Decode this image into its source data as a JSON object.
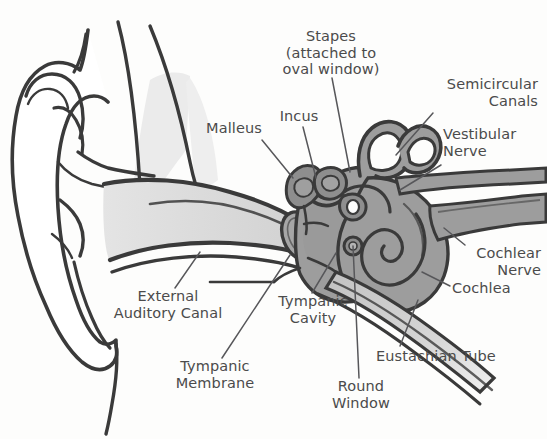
{
  "diagram": {
    "background_color": "#fdfdfc",
    "text_color": "#4b4b4b",
    "outline_color": "#3a3a3a",
    "leader_color": "#57575a",
    "fills": {
      "outer_ear": "#ffffff",
      "ear_canal_light_gray": "#dcdcdc",
      "bone_pale_gray": "#e9e9e9",
      "inner_ear_mid_gray": "#9d9d9d",
      "ossicle_gray": "#8e8e8e",
      "tympanic_membrane_gray": "#a4a4a4",
      "eustachian_gray": "#cfcfcf"
    }
  },
  "labels": {
    "stapes": {
      "lines": [
        "Stapes",
        "(attached to",
        "oval window)"
      ],
      "text": "Stapes\n(attached to\noval window)",
      "align": "center",
      "x": 266,
      "y": 28,
      "width": 130,
      "leader": {
        "from": [
          332,
          78
        ],
        "to": [
          350,
          172
        ]
      }
    },
    "incus": {
      "lines": [
        "Incus"
      ],
      "text": "Incus",
      "align": "center",
      "x": 268,
      "y": 108,
      "width": 62,
      "leader": {
        "from": [
          303,
          127
        ],
        "to": [
          316,
          178
        ]
      }
    },
    "malleus": {
      "lines": [
        "Malleus"
      ],
      "text": "Malleus",
      "align": "center",
      "x": 198,
      "y": 120,
      "width": 72,
      "leader": {
        "from": [
          262,
          140
        ],
        "to": [
          293,
          178
        ]
      }
    },
    "semicircular_canals": {
      "lines": [
        "Semicircular",
        "Canals"
      ],
      "text": "Semicircular\nCanals",
      "align": "right",
      "x": 420,
      "y": 76,
      "width": 118,
      "leader": {
        "from": [
          433,
          113
        ],
        "to": [
          396,
          155
        ]
      }
    },
    "vestibular_nerve": {
      "lines": [
        "Vestibular",
        "Nerve"
      ],
      "text": "Vestibular\nNerve",
      "align": "left",
      "x": 443,
      "y": 126,
      "width": 100,
      "leader": {
        "from": [
          441,
          165
        ],
        "to": [
          400,
          190
        ]
      }
    },
    "cochlear_nerve": {
      "lines": [
        "Cochlear",
        "Nerve"
      ],
      "text": "Cochlear\nNerve",
      "align": "right",
      "x": 455,
      "y": 245,
      "width": 86,
      "leader": {
        "from": [
          465,
          245
        ],
        "to": [
          444,
          228
        ]
      }
    },
    "cochlea": {
      "lines": [
        "Cochlea"
      ],
      "text": "Cochlea",
      "align": "left",
      "x": 452,
      "y": 280,
      "width": 80,
      "leader": {
        "from": [
          450,
          286
        ],
        "to": [
          422,
          272
        ]
      }
    },
    "external_auditory_canal": {
      "lines": [
        "External",
        "Auditory Canal"
      ],
      "text": "External\nAuditory Canal",
      "align": "center",
      "x": 93,
      "y": 288,
      "width": 150,
      "leader": {
        "from": [
          175,
          288
        ],
        "to": [
          200,
          252
        ]
      }
    },
    "tympanic_membrane": {
      "lines": [
        "Tympanic",
        "Membrane"
      ],
      "text": "Tympanic\nMembrane",
      "align": "center",
      "x": 160,
      "y": 358,
      "width": 110,
      "leader": {
        "from": [
          222,
          358
        ],
        "to": [
          290,
          255
        ]
      }
    },
    "tympanic_cavity": {
      "lines": [
        "Tympanic",
        "Cavity"
      ],
      "text": "Tympanic\nCavity",
      "align": "center",
      "x": 268,
      "y": 293,
      "width": 90,
      "leader": {
        "from": [
          312,
          293
        ],
        "to": [
          336,
          253
        ]
      }
    },
    "round_window": {
      "lines": [
        "Round",
        "Window"
      ],
      "text": "Round\nWindow",
      "align": "center",
      "x": 320,
      "y": 378,
      "width": 82,
      "leader": {
        "from": [
          359,
          378
        ],
        "to": [
          353,
          246
        ]
      }
    },
    "eustachian_tube": {
      "lines": [
        "Eustachian Tube"
      ],
      "text": "Eustachian Tube",
      "align": "left",
      "x": 376,
      "y": 348,
      "width": 140,
      "leader": {
        "from": [
          400,
          346
        ],
        "to": [
          418,
          300
        ]
      }
    }
  },
  "structures": [
    {
      "name": "pinna-auricle",
      "region": "outer ear"
    },
    {
      "name": "external-auditory-canal",
      "region": "outer ear"
    },
    {
      "name": "tympanic-membrane",
      "region": "middle ear"
    },
    {
      "name": "malleus",
      "region": "middle ear"
    },
    {
      "name": "incus",
      "region": "middle ear"
    },
    {
      "name": "stapes",
      "region": "middle ear"
    },
    {
      "name": "tympanic-cavity",
      "region": "middle ear"
    },
    {
      "name": "eustachian-tube",
      "region": "middle ear"
    },
    {
      "name": "semicircular-canals",
      "region": "inner ear"
    },
    {
      "name": "vestibular-nerve",
      "region": "inner ear"
    },
    {
      "name": "cochlear-nerve",
      "region": "inner ear"
    },
    {
      "name": "cochlea",
      "region": "inner ear"
    },
    {
      "name": "round-window",
      "region": "inner ear"
    }
  ]
}
